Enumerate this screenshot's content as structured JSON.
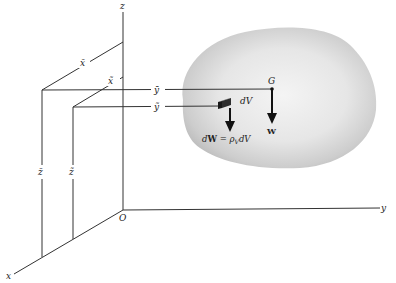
{
  "diagram": {
    "type": "center-of-gravity-3d",
    "axes": {
      "x_label": "x",
      "y_label": "y",
      "z_label": "z",
      "origin_label": "O"
    },
    "centroid_coords": {
      "x_bar": "x̄",
      "y_bar": "ȳ",
      "z_bar": "z̄"
    },
    "element_coords": {
      "x_tilde": "x̃",
      "y_tilde": "ỹ",
      "z_tilde": "z̃"
    },
    "labels": {
      "center_of_gravity": "G",
      "weight": "W",
      "volume_element": "dV",
      "element_weight_eq_lhs": "dW",
      "element_weight_eq": " = ρ",
      "element_weight_sub": "V",
      "element_weight_tail": "dV"
    },
    "colors": {
      "line": "#333333",
      "body_fill": "#d9d9d9",
      "body_edge": "#bdbdbd",
      "element": "#3a3a3a"
    }
  }
}
